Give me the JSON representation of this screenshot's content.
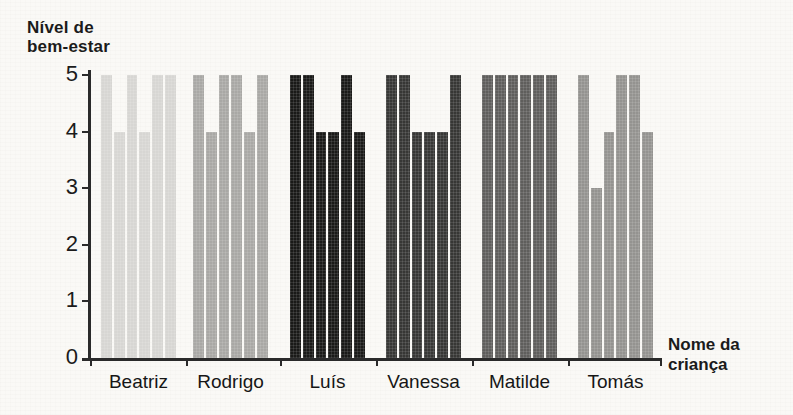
{
  "chart_data": {
    "type": "bar",
    "title": "",
    "ylabel": "Nível de bem-estar",
    "xlabel": "Nome da criança",
    "ylim": [
      0,
      5
    ],
    "yticks": [
      5,
      4,
      3,
      2,
      1,
      0
    ],
    "categories": [
      "Beatriz",
      "Rodrigo",
      "Luís",
      "Vanessa",
      "Matilde",
      "Tomás"
    ],
    "bars_per_group": 6,
    "series": [
      {
        "name": "Beatriz",
        "color": "#d7d6d3",
        "values": [
          5,
          4,
          5,
          4,
          5,
          5
        ]
      },
      {
        "name": "Rodrigo",
        "color": "#a9a8a5",
        "values": [
          5,
          4,
          5,
          5,
          4,
          5
        ]
      },
      {
        "name": "Luís",
        "color": "#1a1a18",
        "values": [
          5,
          5,
          4,
          4,
          5,
          4
        ]
      },
      {
        "name": "Vanessa",
        "color": "#373735",
        "values": [
          5,
          5,
          4,
          4,
          4,
          5
        ]
      },
      {
        "name": "Matilde",
        "color": "#5f5e5c",
        "values": [
          5,
          5,
          5,
          5,
          5,
          5
        ]
      },
      {
        "name": "Tomás",
        "color": "#949390",
        "values": [
          5,
          3,
          4,
          5,
          5,
          4
        ]
      }
    ],
    "legend": null,
    "grid": false
  },
  "axes": {
    "y_title_line1": "Nível de",
    "y_title_line2": "bem-estar",
    "x_title_line1": "Nome da",
    "x_title_line2": "criança",
    "y_tick_labels": [
      "5",
      "4",
      "3",
      "2",
      "1",
      "0"
    ]
  },
  "colors": {
    "axis": "#2a2a2a",
    "text": "#1b1b1b",
    "background": "#faf9f6"
  }
}
